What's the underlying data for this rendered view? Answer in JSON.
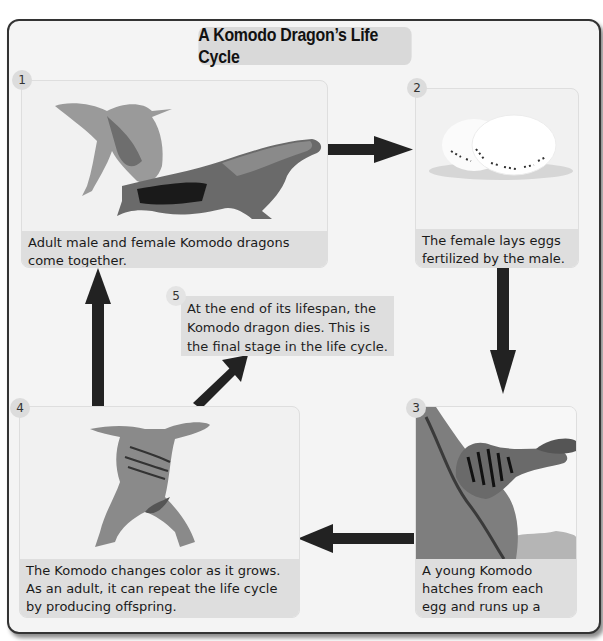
{
  "diagram": {
    "title": "A Komodo Dragon’s Life Cycle",
    "type": "life-cycle",
    "stages": [
      {
        "number": "1",
        "image": "two-adult-komodo-dragons",
        "caption": "Adult male and female Komodo dragons come together."
      },
      {
        "number": "2",
        "image": "two-speckled-eggs",
        "caption": "The female lays eggs fertilized by the male."
      },
      {
        "number": "3",
        "image": "young-striped-komodo-on-tree",
        "caption": "A young Komodo hatches from each egg and runs up a tree."
      },
      {
        "number": "4",
        "image": "juvenile-komodo-dragon",
        "caption": "The Komodo changes color as it grows. As an adult, it can repeat the life cycle by producing offspring."
      },
      {
        "number": "5",
        "image": "",
        "caption": "At the end of its lifespan, the Komodo dragon dies. This is the final stage in the life cycle."
      }
    ],
    "arrows": [
      {
        "from": "1",
        "to": "2",
        "direction": "right"
      },
      {
        "from": "2",
        "to": "3",
        "direction": "down"
      },
      {
        "from": "3",
        "to": "4",
        "direction": "left"
      },
      {
        "from": "4",
        "to": "1",
        "direction": "up"
      },
      {
        "from": "4",
        "to": "5",
        "direction": "up-right"
      }
    ],
    "colors": {
      "background": "#f4f4f4",
      "panel": "#f1f1f1",
      "caption_band": "#dedede",
      "title_box": "#d9d9d9",
      "arrow": "#222222",
      "border": "#333333"
    }
  }
}
